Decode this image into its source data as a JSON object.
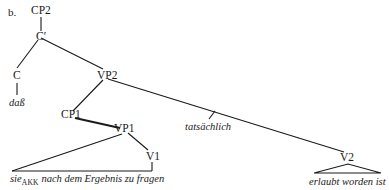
{
  "diagram": {
    "label": "b.",
    "type": "syntax-tree",
    "nodes": {
      "cp2": "CP2",
      "cbar": "C′",
      "c": "C",
      "vp2": "VP2",
      "cp1": "CP1",
      "vp1": "VP1",
      "v1": "V1",
      "v2": "V2"
    },
    "leaves": {
      "dass": "daß",
      "tatsaechlich": "tatsächlich",
      "sie": "sie",
      "sie_case": "AKK",
      "vp1_rest": " nach dem Ergebnis zu fragen",
      "v2_phrase": "erlaubt worden ist"
    },
    "edges": [
      [
        "CP2",
        "C′"
      ],
      [
        "C′",
        "C"
      ],
      [
        "C′",
        "VP2"
      ],
      [
        "C",
        "daß"
      ],
      [
        "VP2",
        "CP1"
      ],
      [
        "VP2",
        "V2"
      ],
      [
        "VP2-V2 edge",
        "tatsächlich"
      ],
      [
        "CP1",
        "VP1"
      ],
      [
        "VP1",
        "triangle: sie_AKK nach dem Ergebnis zu fragen"
      ],
      [
        "VP1",
        "V1"
      ],
      [
        "V2",
        "triangle: erlaubt worden ist"
      ]
    ],
    "line_color": "#1a1a1a"
  }
}
